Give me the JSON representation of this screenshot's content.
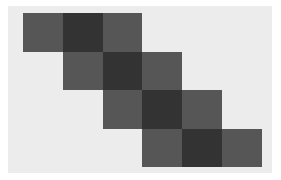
{
  "figure": {
    "width": 281,
    "height": 180,
    "page_background": "#ffffff"
  },
  "plot": {
    "background_color": "#ececec",
    "left": 8,
    "top": 6,
    "width": 264,
    "height": 167,
    "grid_origin_x": 15,
    "grid_origin_y": 7,
    "cell_width": 39.8,
    "cell_height": 38.6
  },
  "colors": {
    "diagonal": "#333333",
    "offdiagonal": "#565656",
    "empty": "#ececec"
  },
  "chart_data": {
    "type": "heatmap",
    "title": "",
    "subtitle": "",
    "xlabel": "",
    "ylabel": "",
    "xticklabels": [],
    "yticklabels": [],
    "grid": false,
    "legend": false,
    "colorbar": false,
    "n_rows": 4,
    "n_cols": 6,
    "xlim": [
      0,
      6
    ],
    "ylim": [
      0,
      4
    ],
    "vmin": 0,
    "vmax": 1,
    "colormap": "gray_r",
    "values": [
      [
        0.66,
        1.0,
        0.66,
        0.0,
        0.0,
        0.0
      ],
      [
        0.0,
        0.66,
        1.0,
        0.66,
        0.0,
        0.0
      ],
      [
        0.0,
        0.0,
        0.66,
        1.0,
        0.66,
        0.0
      ],
      [
        0.0,
        0.0,
        0.0,
        0.66,
        1.0,
        0.66
      ]
    ],
    "cells": [
      {
        "row": 0,
        "col": 0,
        "value": 0.66,
        "color": "#565656"
      },
      {
        "row": 0,
        "col": 1,
        "value": 1.0,
        "color": "#333333"
      },
      {
        "row": 0,
        "col": 2,
        "value": 0.66,
        "color": "#565656"
      },
      {
        "row": 1,
        "col": 1,
        "value": 0.66,
        "color": "#565656"
      },
      {
        "row": 1,
        "col": 2,
        "value": 1.0,
        "color": "#333333"
      },
      {
        "row": 1,
        "col": 3,
        "value": 0.66,
        "color": "#565656"
      },
      {
        "row": 2,
        "col": 2,
        "value": 0.66,
        "color": "#565656"
      },
      {
        "row": 2,
        "col": 3,
        "value": 1.0,
        "color": "#333333"
      },
      {
        "row": 2,
        "col": 4,
        "value": 0.66,
        "color": "#565656"
      },
      {
        "row": 3,
        "col": 3,
        "value": 0.66,
        "color": "#565656"
      },
      {
        "row": 3,
        "col": 4,
        "value": 1.0,
        "color": "#333333"
      },
      {
        "row": 3,
        "col": 5,
        "value": 0.66,
        "color": "#565656"
      }
    ]
  }
}
